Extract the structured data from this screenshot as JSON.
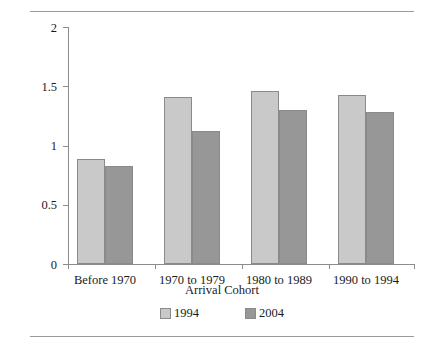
{
  "chart_data": {
    "type": "bar",
    "title": "",
    "xlabel": "Arrival Cohort",
    "ylabel": "Ratio (1 = Parity)",
    "categories": [
      "Before 1970",
      "1970 to 1979",
      "1980 to 1989",
      "1990 to 1994"
    ],
    "series": [
      {
        "name": "1994",
        "values": [
          0.89,
          1.41,
          1.46,
          1.43
        ],
        "color": "#c9c9c9"
      },
      {
        "name": "2004",
        "values": [
          0.83,
          1.12,
          1.3,
          1.28
        ],
        "color": "#979797"
      }
    ],
    "ylim": [
      0,
      2
    ],
    "yticks": [
      "0",
      "0.5",
      "1",
      "1.5",
      "2"
    ],
    "ytick_values": [
      0,
      0.5,
      1,
      1.5,
      2
    ],
    "grid": false,
    "legend_position": "bottom"
  },
  "figure": {
    "caption_clipped": "",
    "border_color": "#9a9a9a"
  }
}
